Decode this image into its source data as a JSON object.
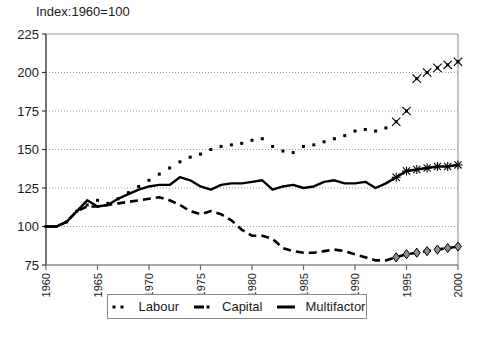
{
  "chart_data": {
    "type": "line",
    "title": "Index:1960=100",
    "xlabel": "",
    "ylabel": "",
    "xlim": [
      1960,
      2000
    ],
    "ylim": [
      75,
      225
    ],
    "yticks": [
      225,
      200,
      175,
      150,
      125,
      100,
      75
    ],
    "xticks": [
      1960,
      1965,
      1970,
      1975,
      1980,
      1985,
      1990,
      1995,
      2000
    ],
    "grid": "horizontal-dotted",
    "legend_position": "below-center",
    "x": [
      1960,
      1961,
      1962,
      1963,
      1964,
      1965,
      1966,
      1967,
      1968,
      1969,
      1970,
      1971,
      1972,
      1973,
      1974,
      1975,
      1976,
      1977,
      1978,
      1979,
      1980,
      1981,
      1982,
      1983,
      1984,
      1985,
      1986,
      1987,
      1988,
      1989,
      1990,
      1991,
      1992,
      1993,
      1994,
      1995,
      1996,
      1997,
      1998,
      1999,
      2000
    ],
    "series": [
      {
        "name": "Labour",
        "style": "dotted",
        "marker": "dot",
        "projection_marker": "x",
        "projection_from": 1994,
        "values": [
          100,
          100,
          103,
          110,
          114,
          117,
          115,
          118,
          122,
          126,
          130,
          134,
          138,
          142,
          145,
          147,
          150,
          152,
          153,
          154,
          156,
          157,
          152,
          149,
          148,
          152,
          153,
          155,
          157,
          159,
          162,
          163,
          162,
          164,
          168,
          175,
          196,
          200,
          203,
          205,
          207
        ]
      },
      {
        "name": "Capital",
        "style": "dashed",
        "marker": "none",
        "projection_marker": "diamond",
        "projection_from": 1994,
        "values": [
          100,
          100,
          103,
          110,
          113,
          113,
          114,
          115,
          116,
          117,
          118,
          119,
          117,
          114,
          110,
          108,
          110,
          108,
          104,
          98,
          94,
          94,
          92,
          86,
          84,
          83,
          83,
          84,
          85,
          84,
          82,
          80,
          78,
          78,
          80,
          82,
          83,
          84,
          85,
          86,
          87
        ]
      },
      {
        "name": "Multifactor",
        "style": "solid",
        "marker": "none",
        "projection_marker": "asterisk",
        "projection_from": 1994,
        "values": [
          100,
          100,
          103,
          110,
          117,
          113,
          114,
          118,
          121,
          124,
          126,
          127,
          127,
          132,
          130,
          126,
          124,
          127,
          128,
          128,
          129,
          130,
          124,
          126,
          127,
          125,
          126,
          129,
          130,
          128,
          128,
          129,
          125,
          128,
          132,
          136,
          137,
          138,
          139,
          139,
          140
        ]
      }
    ]
  },
  "legend": {
    "items": [
      {
        "label": "Labour",
        "swatch": "dotted"
      },
      {
        "label": "Capital",
        "swatch": "dashed"
      },
      {
        "label": "Multifactor",
        "swatch": "solid"
      }
    ]
  }
}
